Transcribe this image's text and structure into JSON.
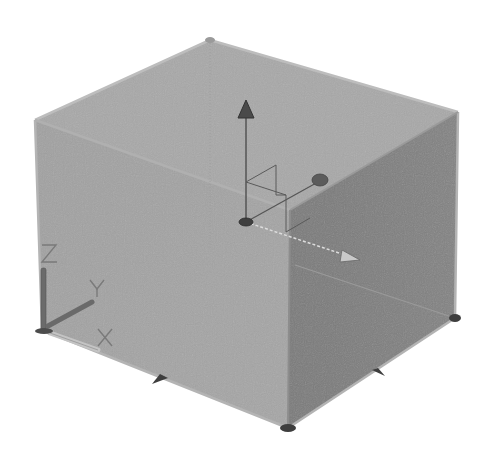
{
  "viewport": {
    "type": "3d-modeling-viewport",
    "background": "#ffffff",
    "visual_style": "shaded-gray"
  },
  "model": {
    "object": "box",
    "faces": {
      "top": {
        "color": "#a9a9a9"
      },
      "front_left": {
        "color": "#a3a3a3"
      },
      "right": {
        "color": "#7d7d7d"
      }
    },
    "edge_color": "#b8b8b8"
  },
  "move_gizmo": {
    "name": "move-gizmo",
    "axes": {
      "z": "Z",
      "y": "Y",
      "x": "X"
    },
    "color": "#5a5a5a"
  },
  "ucs_icon": {
    "labels": {
      "z": "Z",
      "y": "Y",
      "x": "X"
    },
    "color": "#6a6a6a"
  },
  "grips": {
    "count": 4,
    "color": "#555555"
  }
}
